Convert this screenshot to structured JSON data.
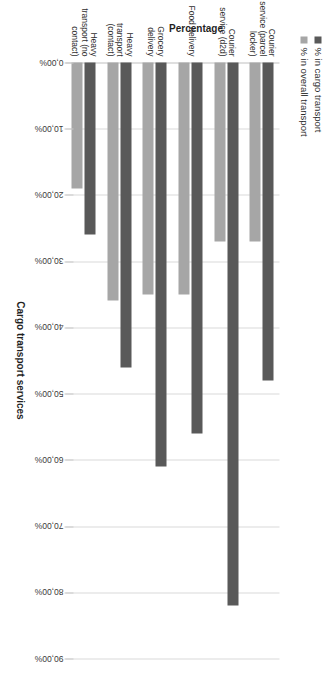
{
  "chart_data": {
    "type": "bar",
    "orientation": "horizontal",
    "title": "",
    "xlabel": "Cargo transport services",
    "ylabel": "Percentage",
    "categories": [
      "Courier service (parcel locker)",
      "Courier service (d2d)",
      "Food delivery",
      "Grocery delivery",
      "Heavy transport (contact)",
      "Heavy transport (no contact)"
    ],
    "series": [
      {
        "name": "% in cargo transport",
        "color": "#595959",
        "values": [
          48.0,
          82.0,
          56.0,
          61.0,
          46.0,
          26.0
        ]
      },
      {
        "name": "% in overall transport",
        "color": "#a6a6a6",
        "values": [
          27.0,
          27.0,
          35.0,
          35.0,
          36.0,
          19.0
        ]
      }
    ],
    "ylim": [
      0,
      90
    ],
    "tick_labels": [
      "0,00%",
      "10,00%",
      "20,00%",
      "30,00%",
      "40,00%",
      "50,00%",
      "60,00%",
      "70,00%",
      "80,00%",
      "90,00%"
    ],
    "tick_values": [
      0,
      10,
      20,
      30,
      40,
      50,
      60,
      70,
      80,
      90
    ],
    "grid": true,
    "legend_position": "top-left"
  }
}
